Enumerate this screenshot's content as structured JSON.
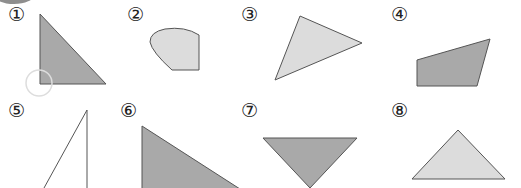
{
  "figure": {
    "labels": [
      "①",
      "②",
      "③",
      "④",
      "⑤",
      "⑥",
      "⑦",
      "⑧"
    ],
    "colors": {
      "dark_fill": "#a9a9a9",
      "light_fill": "#dcdcdc",
      "stroke": "#555555",
      "highlight_circle": "#dddddd"
    },
    "shapes": [
      {
        "id": 1,
        "kind": "right-triangle",
        "fill": "dark"
      },
      {
        "id": 2,
        "kind": "curved-pentagon",
        "fill": "light"
      },
      {
        "id": 3,
        "kind": "triangle",
        "fill": "light"
      },
      {
        "id": 4,
        "kind": "quadrilateral",
        "fill": "dark"
      },
      {
        "id": 5,
        "kind": "triangle-outline",
        "fill": "none"
      },
      {
        "id": 6,
        "kind": "right-triangle",
        "fill": "dark"
      },
      {
        "id": 7,
        "kind": "inverted-triangle",
        "fill": "dark"
      },
      {
        "id": 8,
        "kind": "isosceles-triangle",
        "fill": "light"
      }
    ]
  }
}
